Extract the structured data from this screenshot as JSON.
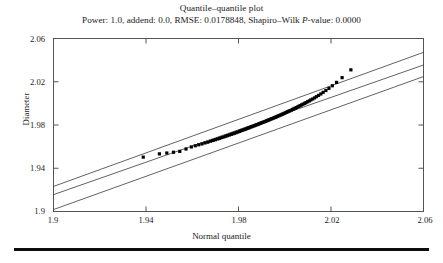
{
  "figure": {
    "title": "Quantile–quantile plot",
    "subtitle_parts": {
      "before": "Power: 1.0, addend: 0.0, RMSE: 0.0178848, Shapiro–Wilk ",
      "italic": "P",
      "after": "-value: 0.0000"
    },
    "subtitle": "Power: 1.0, addend: 0.0, RMSE: 0.0178848, Shapiro–Wilk P-value: 0.0000"
  },
  "chart_data": {
    "type": "scatter",
    "title": "Quantile–quantile plot",
    "subtitle": "Power: 1.0, addend: 0.0, RMSE: 0.0178848, Shapiro–Wilk P-value: 0.0000",
    "xlabel": "Normal quantile",
    "ylabel": "Diameter",
    "xlim": [
      1.9,
      2.06
    ],
    "ylim": [
      1.9,
      2.06
    ],
    "xticks": [
      1.9,
      1.94,
      1.98,
      2.02,
      2.06
    ],
    "yticks": [
      1.9,
      1.94,
      1.98,
      2.02,
      2.06
    ],
    "xtick_labels": [
      "1.9",
      "1.94",
      "1.98",
      "2.02",
      "2.06"
    ],
    "ytick_labels": [
      "1.9",
      "1.94",
      "1.98",
      "2.02",
      "2.06"
    ],
    "grid": false,
    "legend": "none",
    "marker": "filled-square",
    "marker_color": "#000000",
    "marker_size_px": 3.2,
    "statistics": {
      "power": 1.0,
      "addend": 0.0,
      "rmse": 0.0178848,
      "shapiro_wilk_p_value": 0.0
    },
    "reference_lines": [
      {
        "name": "fit-line",
        "x": [
          1.9,
          2.06
        ],
        "y": [
          1.9156,
          2.0355
        ],
        "color": "#3a3a3a",
        "width_px": 0.8
      },
      {
        "name": "upper-band",
        "x": [
          1.9,
          2.06
        ],
        "y": [
          1.9232,
          2.0472
        ],
        "color": "#3a3a3a",
        "width_px": 0.8
      },
      {
        "name": "lower-band",
        "x": [
          1.9,
          2.06
        ],
        "y": [
          1.9018,
          2.0248
        ],
        "color": "#3a3a3a",
        "width_px": 0.8
      }
    ],
    "points": [
      [
        1.9388,
        1.9503
      ],
      [
        1.9458,
        1.9533
      ],
      [
        1.949,
        1.9541
      ],
      [
        1.9519,
        1.9548
      ],
      [
        1.9546,
        1.9556
      ],
      [
        1.9573,
        1.9578
      ],
      [
        1.9596,
        1.9597
      ],
      [
        1.9613,
        1.9608
      ],
      [
        1.9628,
        1.9617
      ],
      [
        1.9642,
        1.9625
      ],
      [
        1.9655,
        1.9634
      ],
      [
        1.9667,
        1.9641
      ],
      [
        1.9679,
        1.965
      ],
      [
        1.969,
        1.9657
      ],
      [
        1.97,
        1.9664
      ],
      [
        1.971,
        1.9671
      ],
      [
        1.9719,
        1.9677
      ],
      [
        1.9728,
        1.9684
      ],
      [
        1.9737,
        1.969
      ],
      [
        1.9745,
        1.9696
      ],
      [
        1.9753,
        1.9702
      ],
      [
        1.9761,
        1.9708
      ],
      [
        1.9769,
        1.9714
      ],
      [
        1.9776,
        1.9719
      ],
      [
        1.9783,
        1.9724
      ],
      [
        1.979,
        1.973
      ],
      [
        1.9797,
        1.9735
      ],
      [
        1.9804,
        1.9741
      ],
      [
        1.981,
        1.9746
      ],
      [
        1.9816,
        1.9751
      ],
      [
        1.9823,
        1.9756
      ],
      [
        1.9829,
        1.9761
      ],
      [
        1.9835,
        1.9766
      ],
      [
        1.9841,
        1.9771
      ],
      [
        1.9846,
        1.9775
      ],
      [
        1.9852,
        1.978
      ],
      [
        1.9858,
        1.9785
      ],
      [
        1.9863,
        1.9789
      ],
      [
        1.9869,
        1.9794
      ],
      [
        1.9874,
        1.9798
      ],
      [
        1.988,
        1.9803
      ],
      [
        1.9885,
        1.9807
      ],
      [
        1.989,
        1.9812
      ],
      [
        1.9895,
        1.9816
      ],
      [
        1.99,
        1.982
      ],
      [
        1.9906,
        1.9825
      ],
      [
        1.9911,
        1.9829
      ],
      [
        1.9916,
        1.9833
      ],
      [
        1.9921,
        1.9838
      ],
      [
        1.9926,
        1.9842
      ],
      [
        1.993,
        1.9846
      ],
      [
        1.9935,
        1.985
      ],
      [
        1.994,
        1.9855
      ],
      [
        1.9945,
        1.9859
      ],
      [
        1.995,
        1.9863
      ],
      [
        1.9955,
        1.9868
      ],
      [
        1.996,
        1.9872
      ],
      [
        1.9964,
        1.9876
      ],
      [
        1.9969,
        1.9881
      ],
      [
        1.9974,
        1.9885
      ],
      [
        1.9979,
        1.989
      ],
      [
        1.9984,
        1.9894
      ],
      [
        1.9989,
        1.9899
      ],
      [
        1.9993,
        1.9903
      ],
      [
        1.9998,
        1.9908
      ],
      [
        2.0003,
        1.9913
      ],
      [
        2.0008,
        1.9918
      ],
      [
        2.0013,
        1.9923
      ],
      [
        2.0018,
        1.9928
      ],
      [
        2.0023,
        1.9933
      ],
      [
        2.0029,
        1.9938
      ],
      [
        2.0034,
        1.9944
      ],
      [
        2.0039,
        1.9949
      ],
      [
        2.0045,
        1.9955
      ],
      [
        2.005,
        1.9961
      ],
      [
        2.0056,
        1.9967
      ],
      [
        2.0061,
        1.9973
      ],
      [
        2.0067,
        1.9979
      ],
      [
        2.0073,
        1.9986
      ],
      [
        2.0079,
        1.9993
      ],
      [
        2.0086,
        2.0
      ],
      [
        2.0092,
        2.0007
      ],
      [
        2.0099,
        2.0015
      ],
      [
        2.0106,
        2.0023
      ],
      [
        2.0113,
        2.0032
      ],
      [
        2.0121,
        2.0041
      ],
      [
        2.0129,
        2.0051
      ],
      [
        2.0137,
        2.0062
      ],
      [
        2.0146,
        2.0074
      ],
      [
        2.0156,
        2.0087
      ],
      [
        2.0166,
        2.0102
      ],
      [
        2.0178,
        2.0119
      ],
      [
        2.0191,
        2.0139
      ],
      [
        2.0206,
        2.0163
      ],
      [
        2.0224,
        2.0194
      ],
      [
        2.0248,
        2.0238
      ],
      [
        2.0286,
        2.031
      ]
    ]
  },
  "tick_labels": {
    "y": [
      "2.06",
      "2.02",
      "1.98",
      "1.94",
      "1.9"
    ],
    "x": [
      "1.9",
      "1.94",
      "1.98",
      "2.02",
      "2.06"
    ]
  }
}
